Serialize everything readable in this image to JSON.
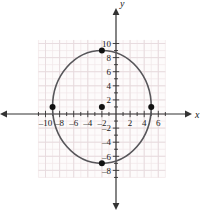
{
  "chart_data": {
    "type": "scatter",
    "title": "",
    "xlabel": "x",
    "ylabel": "y",
    "xlim": [
      -11.5,
      7.5
    ],
    "ylim": [
      -9.5,
      11.0
    ],
    "grid": true,
    "legend": null,
    "x_ticks": [
      -10,
      -8,
      -6,
      -4,
      -2,
      2,
      4,
      6
    ],
    "y_ticks": [
      10,
      8,
      6,
      4,
      2,
      -2,
      -4,
      -6,
      -8
    ],
    "x_tick_labels": [
      "–10",
      "–8",
      "–6",
      "–4",
      "–2",
      "2",
      "4",
      "6"
    ],
    "y_tick_labels": [
      "10",
      "8",
      "6",
      "4",
      "2",
      "–2",
      "–4",
      "–6",
      "–8"
    ],
    "x_minor_step": 1,
    "y_minor_step": 1,
    "curves": [
      {
        "name": "ellipse",
        "shape": "ellipse",
        "center": [
          -2,
          1
        ],
        "semi_axis_x": 7,
        "semi_axis_y": 8,
        "color": "#57565a",
        "stroke_width": 1.6
      }
    ],
    "points": [
      {
        "name": "top-vertex",
        "x": -2,
        "y": 9
      },
      {
        "name": "bottom-vertex",
        "x": -2,
        "y": -7
      },
      {
        "name": "left-vertex",
        "x": -9,
        "y": 1
      },
      {
        "name": "right-vertex",
        "x": 5,
        "y": 1
      },
      {
        "name": "center",
        "x": -2,
        "y": 1
      }
    ],
    "point_color": "#111111",
    "point_radius": 3,
    "grid_color": "#f0e6e8",
    "grid_major_color": "#e6dade",
    "axis_color": "#333333",
    "background": "#ffffff",
    "plot_area": {
      "x_range": [
        -11.0,
        7.0
      ],
      "y_range": [
        -9.0,
        10.5
      ],
      "fill": "#fdfbfb"
    }
  },
  "labels": {
    "x_axis_name": "x",
    "y_axis_name": "y"
  }
}
